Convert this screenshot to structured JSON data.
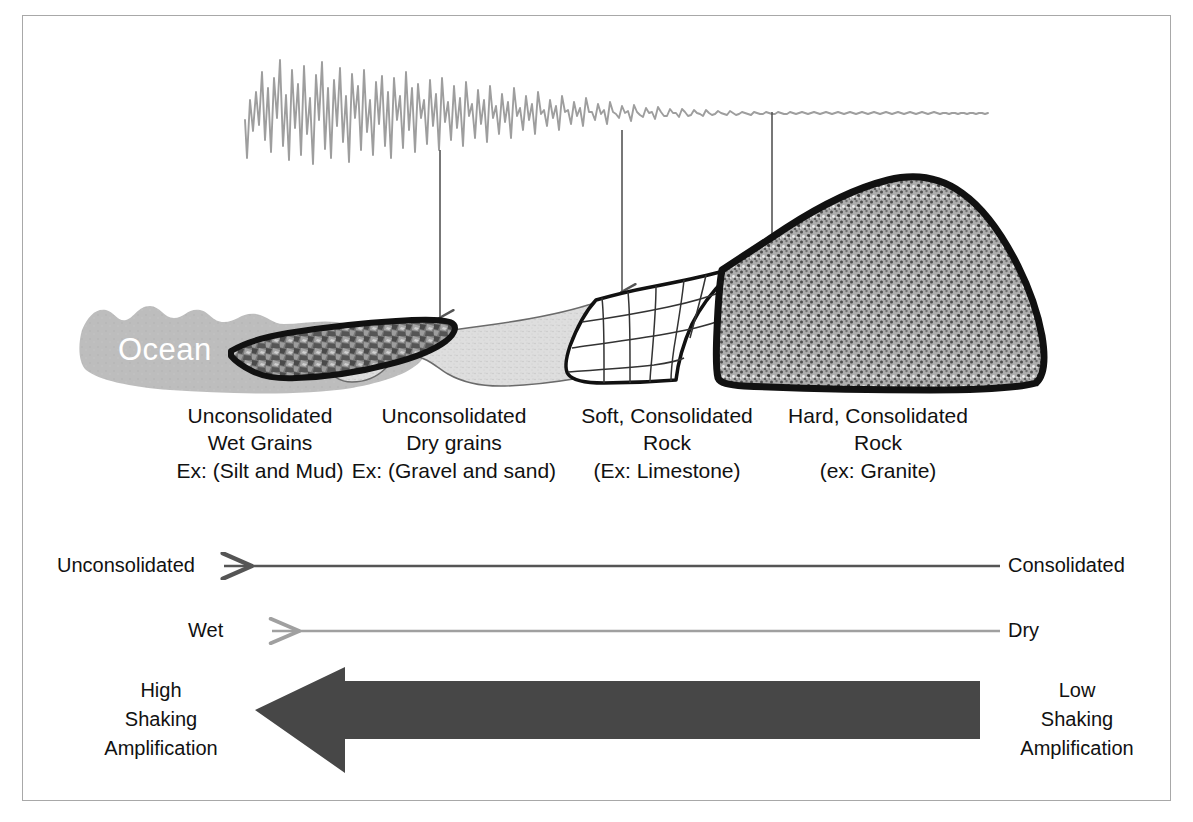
{
  "figure": {
    "border_color": "#a8a8a8",
    "background": "#ffffff"
  },
  "seismogram": {
    "name": "seismic-waveform",
    "description": "Seismic trace with large amplitude at left decaying to nearly flat at right",
    "stroke_color": "#9a9a9a"
  },
  "cross_section": {
    "ocean_label": "Ocean",
    "ocean_color": "#bcbcbc",
    "mud_color": "#6e6e6e",
    "sand_color": "#dcdcdc",
    "limestone_color": "#ffffff",
    "granite_color": "#9c9c9c",
    "outline_color": "#111111",
    "pointer_color": "#555555",
    "pointers": [
      {
        "name": "pointer-wet-grains",
        "x": 440
      },
      {
        "name": "pointer-soft-rock",
        "x": 622
      },
      {
        "name": "pointer-hard-rock",
        "x": 772
      }
    ]
  },
  "material_labels": [
    {
      "name": "label-unconsolidated-wet-grains",
      "lines": [
        "Unconsolidated",
        "Wet Grains",
        "Ex: (Silt and Mud)"
      ]
    },
    {
      "name": "label-unconsolidated-dry-grains",
      "lines": [
        "Unconsolidated",
        "Dry grains",
        "Ex: (Gravel and sand)"
      ]
    },
    {
      "name": "label-soft-consolidated-rock",
      "lines": [
        "Soft, Consolidated",
        "Rock",
        "(Ex: Limestone)"
      ]
    },
    {
      "name": "label-hard-consolidated-rock",
      "lines": [
        "Hard, Consolidated",
        "Rock",
        "(ex: Granite)"
      ]
    }
  ],
  "scales": [
    {
      "name": "scale-consolidation",
      "left_label": "Unconsolidated",
      "right_label": "Consolidated",
      "arrow_color": "#555555",
      "arrow_direction": "left"
    },
    {
      "name": "scale-moisture",
      "left_label": "Wet",
      "right_label": "Dry",
      "arrow_color": "#a0a0a0",
      "arrow_direction": "left"
    }
  ],
  "amplification": {
    "name": "shaking-amplification-arrow",
    "arrow_color": "#474747",
    "arrow_direction": "left",
    "high_lines": [
      "High",
      "Shaking",
      "Amplification"
    ],
    "low_lines": [
      "Low",
      "Shaking",
      "Amplification"
    ]
  }
}
